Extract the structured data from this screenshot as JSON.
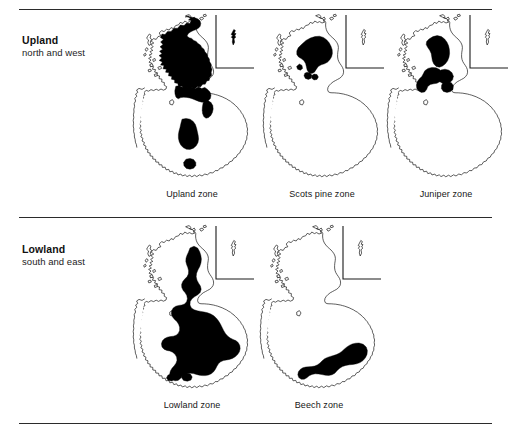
{
  "figure": {
    "background_color": "#ffffff",
    "line_color": "#2b2b2b",
    "zone_fill_color": "#000000",
    "coast_stroke_color": "#1a1a1a"
  },
  "bands": [
    {
      "id": "upland",
      "title": "Upland",
      "subtitle": "north and west",
      "maps": [
        {
          "id": "upland-zone",
          "caption": "Upland zone",
          "inset_label": "shetland-inset"
        },
        {
          "id": "scots-pine-zone",
          "caption": "Scots pine zone",
          "inset_label": "shetland-inset"
        },
        {
          "id": "juniper-zone",
          "caption": "Juniper zone",
          "inset_label": "shetland-inset"
        }
      ]
    },
    {
      "id": "lowland",
      "title": "Lowland",
      "subtitle": "south and east",
      "maps": [
        {
          "id": "lowland-zone",
          "caption": "Lowland zone",
          "inset_label": "shetland-inset"
        },
        {
          "id": "beech-zone",
          "caption": "Beech zone",
          "inset_label": "shetland-inset"
        }
      ]
    }
  ],
  "rules": {
    "top": "divider-top",
    "middle": "divider-middle",
    "bottom": "divider-bottom"
  }
}
